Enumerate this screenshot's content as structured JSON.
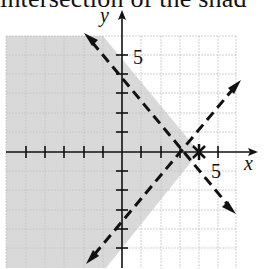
{
  "caption": "intersection of the shad",
  "graph": {
    "x_label": "x",
    "y_label": "y",
    "x_tick_label": "5",
    "y_tick_label": "5",
    "intersection_point": [
      4,
      0
    ],
    "lines": [
      {
        "name": "boundary-1",
        "style": "dashed",
        "points": [
          [
            -1,
            5
          ],
          [
            5,
            -1
          ]
        ],
        "equation": "x + y = 4"
      },
      {
        "name": "boundary-2",
        "style": "dashed",
        "points": [
          [
            -1.5,
            -5.5
          ],
          [
            5.5,
            1.5
          ]
        ],
        "equation": "y = x - 4"
      }
    ],
    "shaded_region": "x + y < 4 and y > x - 4",
    "colors": {
      "shade": "#d9d9d9",
      "grid": "#bdbdbd",
      "axis": "#111111",
      "line": "#111111"
    }
  }
}
